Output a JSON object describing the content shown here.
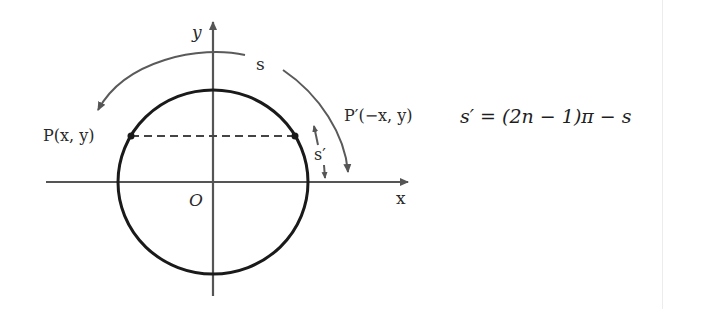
{
  "diagram": {
    "axis_labels": {
      "x": "x",
      "y": "y",
      "origin": "O"
    },
    "points": {
      "p": "P(x, y)",
      "p_prime": "P′(−x, y)"
    },
    "arc_labels": {
      "s": "s",
      "s_prime": "s′"
    }
  },
  "formula": "s′ = (2n − 1)π − s",
  "colors": {
    "circle": "#1a1a1a",
    "axes": "#555555",
    "arcs": "#5a5a5a"
  }
}
